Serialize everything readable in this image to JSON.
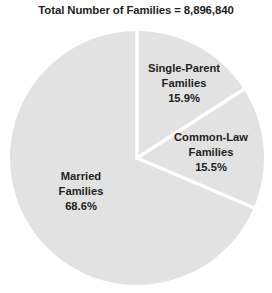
{
  "chart_data": {
    "type": "pie",
    "title": "Total Number of Families = 8,896,840",
    "total_label": "Total Number of Families",
    "total_value": "8,896,840",
    "categories": [
      "Single-Parent Families",
      "Common-Law Families",
      "Married Families"
    ],
    "values": [
      15.9,
      15.5,
      68.6
    ],
    "value_labels": [
      "15.9%",
      "15.5%",
      "68.6%"
    ],
    "start_angle_deg": 0,
    "direction": "clockwise",
    "legend": "none",
    "grid": false,
    "slice_color": "#e2e2e2",
    "separator_color": "#ffffff",
    "text_color": "#231f20",
    "background": "#ffffff",
    "slices": [
      {
        "name": "Single-Parent Families",
        "line1": "Single-Parent",
        "line2": "Families",
        "percent": "15.9%",
        "value": 15.9,
        "color": "#e2e2e2"
      },
      {
        "name": "Common-Law Families",
        "line1": "Common-Law",
        "line2": "Families",
        "percent": "15.5%",
        "value": 15.5,
        "color": "#e2e2e2"
      },
      {
        "name": "Married Families",
        "line1": "Married",
        "line2": "Families",
        "percent": "68.6%",
        "value": 68.6,
        "color": "#e2e2e2"
      }
    ]
  }
}
